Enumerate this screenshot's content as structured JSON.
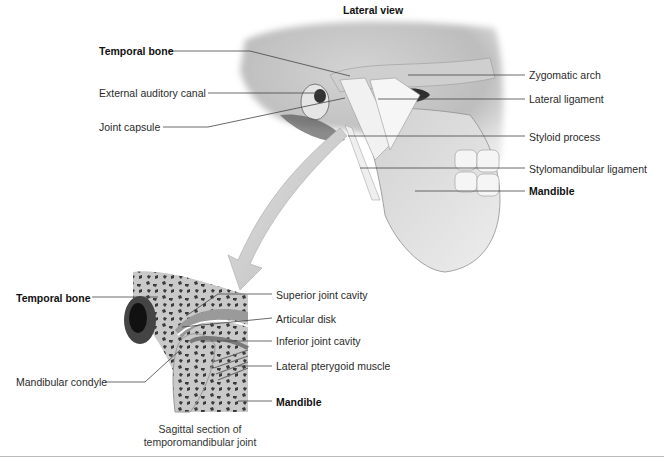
{
  "figure": {
    "lateral_title": "Lateral view",
    "lateral_labels_left": [
      {
        "id": "temporal-bone",
        "text": "Temporal bone",
        "bold": true
      },
      {
        "id": "external-auditory-canal",
        "text": "External auditory canal",
        "bold": false
      },
      {
        "id": "joint-capsule",
        "text": "Joint capsule",
        "bold": false
      }
    ],
    "lateral_labels_right": [
      {
        "id": "zygomatic-arch",
        "text": "Zygomatic arch",
        "bold": false
      },
      {
        "id": "lateral-ligament",
        "text": "Lateral ligament",
        "bold": false
      },
      {
        "id": "styloid-process",
        "text": "Styloid process",
        "bold": false
      },
      {
        "id": "stylomandibular-ligament",
        "text": "Stylomandibular ligament",
        "bold": false
      },
      {
        "id": "mandible",
        "text": "Mandible",
        "bold": true
      }
    ],
    "section_labels_left": [
      {
        "id": "temporal-bone",
        "text": "Temporal bone",
        "bold": true
      },
      {
        "id": "mandibular-condyle",
        "text": "Mandibular condyle",
        "bold": false
      }
    ],
    "section_labels_right": [
      {
        "id": "superior-joint-cavity",
        "text": "Superior joint cavity",
        "bold": false
      },
      {
        "id": "articular-disk",
        "text": "Articular disk",
        "bold": false
      },
      {
        "id": "inferior-joint-cavity",
        "text": "Inferior joint cavity",
        "bold": false
      },
      {
        "id": "lateral-pterygoid-muscle",
        "text": "Lateral pterygoid muscle",
        "bold": false
      },
      {
        "id": "mandible",
        "text": "Mandible",
        "bold": true
      }
    ],
    "section_caption_line1": "Sagittal section of",
    "section_caption_line2": "temporomandibular joint"
  }
}
